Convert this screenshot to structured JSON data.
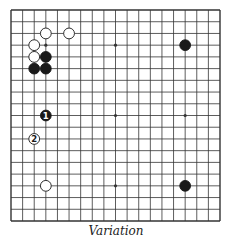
{
  "diagram": {
    "type": "go-board",
    "size": 19,
    "caption": "Variation",
    "colors": {
      "line": "#333333",
      "black_stone": "#1a1a1a",
      "white_stone": "#ffffff",
      "background": "#ffffff"
    },
    "star_points": [
      [
        3,
        3
      ],
      [
        9,
        3
      ],
      [
        15,
        3
      ],
      [
        3,
        9
      ],
      [
        9,
        9
      ],
      [
        15,
        9
      ],
      [
        3,
        15
      ],
      [
        9,
        15
      ],
      [
        15,
        15
      ]
    ],
    "stones": [
      {
        "color": "white",
        "col": 3,
        "row": 2,
        "label": ""
      },
      {
        "color": "white",
        "col": 5,
        "row": 2,
        "label": ""
      },
      {
        "color": "white",
        "col": 2,
        "row": 3,
        "label": ""
      },
      {
        "color": "white",
        "col": 2,
        "row": 4,
        "label": ""
      },
      {
        "color": "black",
        "col": 3,
        "row": 4,
        "label": ""
      },
      {
        "color": "black",
        "col": 2,
        "row": 5,
        "label": ""
      },
      {
        "color": "black",
        "col": 3,
        "row": 5,
        "label": ""
      },
      {
        "color": "black",
        "col": 15,
        "row": 3,
        "label": ""
      },
      {
        "color": "black",
        "col": 3,
        "row": 9,
        "label": "1"
      },
      {
        "color": "white",
        "col": 2,
        "row": 11,
        "label": "2"
      },
      {
        "color": "white",
        "col": 3,
        "row": 15,
        "label": ""
      },
      {
        "color": "black",
        "col": 15,
        "row": 15,
        "label": ""
      }
    ]
  }
}
